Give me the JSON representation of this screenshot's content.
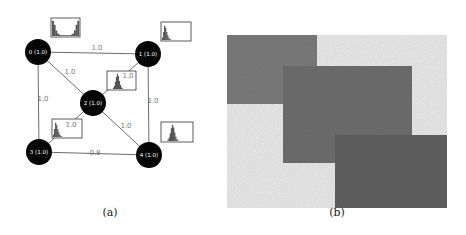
{
  "figure": {
    "panels": [
      {
        "id": "a",
        "caption": "(a)",
        "type": "graph",
        "nodes": [
          {
            "id": 0,
            "label": "0 (1.0)",
            "x": 38,
            "y": 52
          },
          {
            "id": 1,
            "label": "1 (1.0)",
            "x": 148,
            "y": 54
          },
          {
            "id": 2,
            "label": "2 (1.0)",
            "x": 93,
            "y": 103
          },
          {
            "id": 3,
            "label": "3 (1.0)",
            "x": 39,
            "y": 152
          },
          {
            "id": 4,
            "label": "4 (1.0)",
            "x": 149,
            "y": 155
          }
        ],
        "edges": [
          {
            "from": 0,
            "to": 1,
            "label": "1.0",
            "lx": 97,
            "ly": 50
          },
          {
            "from": 0,
            "to": 2,
            "label": "1.0",
            "lx": 70,
            "ly": 74
          },
          {
            "from": 1,
            "to": 2,
            "label": "1.0",
            "lx": 128,
            "ly": 78
          },
          {
            "from": 0,
            "to": 3,
            "label": "1.0",
            "lx": 43,
            "ly": 101
          },
          {
            "from": 1,
            "to": 4,
            "label": "1.0",
            "lx": 153,
            "ly": 103
          },
          {
            "from": 2,
            "to": 3,
            "label": "1.0",
            "lx": 71,
            "ly": 127
          },
          {
            "from": 2,
            "to": 4,
            "label": "1.0",
            "lx": 126,
            "ly": 128
          },
          {
            "from": 3,
            "to": 4,
            "label": "0.8",
            "lx": 95,
            "ly": 155
          }
        ],
        "histograms": [
          {
            "node": 0,
            "x": 51,
            "y": 18,
            "w": 29,
            "h": 19,
            "shape": "u-shape"
          },
          {
            "node": 1,
            "x": 161,
            "y": 22,
            "w": 30,
            "h": 19,
            "shape": "left-skewed"
          },
          {
            "node": 2,
            "x": 107,
            "y": 71,
            "w": 29,
            "h": 19,
            "shape": "centered"
          },
          {
            "node": 3,
            "x": 52,
            "y": 119,
            "w": 30,
            "h": 19,
            "shape": "left-skewed"
          },
          {
            "node": 4,
            "x": 161,
            "y": 122,
            "w": 32,
            "h": 20,
            "shape": "centered"
          }
        ],
        "colors": {
          "node_fill": "#050505",
          "edge_stroke": "#5a5a5a",
          "histogram_fill": "#555555",
          "histogram_border": "#333333"
        }
      },
      {
        "id": "b",
        "caption": "(b)",
        "type": "overlapping-rectangles",
        "background": {
          "x": 227,
          "y": 35,
          "w": 220,
          "h": 173,
          "color": "#e9e9e9"
        },
        "rectangles": [
          {
            "name": "top-left",
            "x": 227,
            "y": 35,
            "w": 90,
            "h": 69,
            "color": "#7b7b7b"
          },
          {
            "name": "middle",
            "x": 283,
            "y": 66,
            "w": 129,
            "h": 97,
            "color": "#6e6e6e"
          },
          {
            "name": "bottom-right",
            "x": 335,
            "y": 135,
            "w": 112,
            "h": 73,
            "color": "#626262"
          }
        ]
      }
    ]
  }
}
